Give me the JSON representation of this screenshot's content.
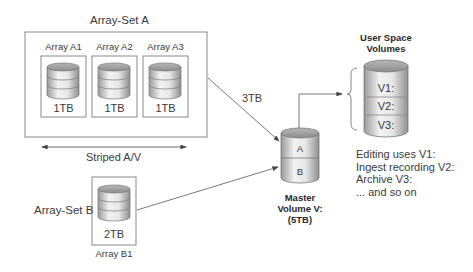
{
  "array_set_a": {
    "title": "Array-Set A",
    "arrays": [
      {
        "label": "Array A1",
        "capacity": "1TB"
      },
      {
        "label": "Array A2",
        "capacity": "1TB"
      },
      {
        "label": "Array A3",
        "capacity": "1TB"
      }
    ],
    "striping_label": "Striped A/V",
    "link_label": "3TB"
  },
  "array_set_b": {
    "title": "Array-Set B",
    "array": {
      "label": "Array B1",
      "capacity": "2TB"
    }
  },
  "master_volume": {
    "segments": [
      "A",
      "B"
    ],
    "caption_lines": [
      "Master",
      "Volume V:",
      "(5TB)"
    ]
  },
  "user_space": {
    "title_lines": [
      "User Space",
      "Volumes"
    ],
    "volumes": [
      "V1:",
      "V2:",
      "V3:"
    ],
    "notes": [
      "Editing uses V1:",
      "Ingest recording V2:",
      "Archive V3:",
      "... and so on"
    ]
  }
}
